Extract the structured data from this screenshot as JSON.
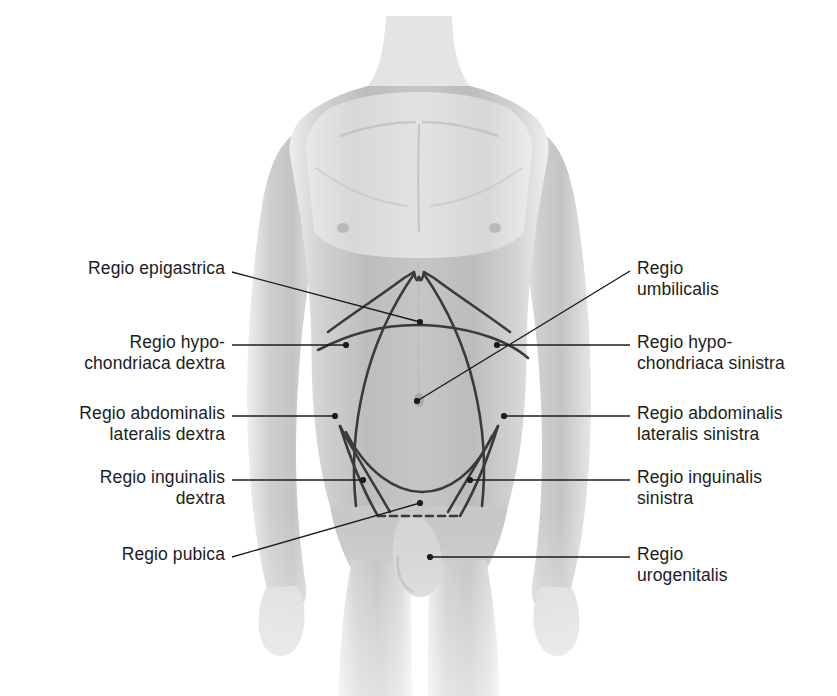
{
  "figure": {
    "background_color": "#ffffff",
    "line_color": "#333333",
    "text_color": "#1c1c1c",
    "skin_light": "#f2f2f2",
    "skin_mid": "#c9c9c9",
    "skin_dark": "#9a9a9a"
  },
  "labels": {
    "left": [
      {
        "id": "regio-epigastrica",
        "lines": [
          "Regio epigastrica"
        ],
        "text_right_x": 225,
        "text_top_y": 258,
        "leader": {
          "x1": 232,
          "y1": 272,
          "x2": 420,
          "y2": 322,
          "style": "solid",
          "dot": true
        }
      },
      {
        "id": "regio-hypochondriaca-dextra",
        "lines": [
          "Regio hypo-",
          "chondriaca dextra"
        ],
        "text_right_x": 225,
        "text_top_y": 332,
        "leader": {
          "x1": 232,
          "y1": 345,
          "x2": 346,
          "y2": 345,
          "style": "solid",
          "dot": true
        }
      },
      {
        "id": "regio-abdominalis-lateralis-dextra",
        "lines": [
          "Regio abdominalis",
          "lateralis dextra"
        ],
        "text_right_x": 225,
        "text_top_y": 403,
        "leader": {
          "x1": 232,
          "y1": 416,
          "x2": 335,
          "y2": 416,
          "style": "solid",
          "dot": true
        }
      },
      {
        "id": "regio-inguinalis-dextra",
        "lines": [
          "Regio inguinalis",
          "dextra"
        ],
        "text_right_x": 225,
        "text_top_y": 467,
        "leader": {
          "x1": 232,
          "y1": 480,
          "x2": 363,
          "y2": 480,
          "style": "solid",
          "dot": true
        }
      },
      {
        "id": "regio-pubica",
        "lines": [
          "Regio pubica"
        ],
        "text_right_x": 225,
        "text_top_y": 544,
        "leader": {
          "x1": 232,
          "y1": 557,
          "x2": 420,
          "y2": 503,
          "style": "solid",
          "dot": true
        }
      }
    ],
    "right": [
      {
        "id": "regio-umbilicalis",
        "lines": [
          "Regio",
          "umbilicalis"
        ],
        "text_left_x": 637,
        "text_top_y": 258,
        "leader": {
          "x1": 630,
          "y1": 271,
          "x2": 417,
          "y2": 401,
          "style": "solid",
          "dot": true
        }
      },
      {
        "id": "regio-hypochondriaca-sinistra",
        "lines": [
          "Regio hypo-",
          "chondriaca sinistra"
        ],
        "text_left_x": 637,
        "text_top_y": 332,
        "leader": {
          "x1": 630,
          "y1": 345,
          "x2": 497,
          "y2": 345,
          "style": "solid",
          "dot": true
        }
      },
      {
        "id": "regio-abdominalis-lateralis-sinistra",
        "lines": [
          "Regio abdominalis",
          "lateralis sinistra"
        ],
        "text_left_x": 637,
        "text_top_y": 403,
        "leader": {
          "x1": 630,
          "y1": 416,
          "x2": 504,
          "y2": 416,
          "style": "solid",
          "dot": true
        }
      },
      {
        "id": "regio-inguinalis-sinistra",
        "lines": [
          "Regio inguinalis",
          "sinistra"
        ],
        "text_left_x": 637,
        "text_top_y": 467,
        "leader": {
          "x1": 630,
          "y1": 480,
          "x2": 470,
          "y2": 480,
          "style": "solid",
          "dot": true
        }
      },
      {
        "id": "regio-urogenitalis",
        "lines": [
          "Regio",
          "urogenitalis"
        ],
        "text_left_x": 637,
        "text_top_y": 544,
        "leader": {
          "x1": 630,
          "y1": 557,
          "x2": 430,
          "y2": 557,
          "style": "solid",
          "dot": true
        }
      }
    ]
  },
  "region_boundaries": {
    "note": "hand-drawn demarcation curves over the abdomen",
    "has_dashed_pubic_line": true
  }
}
